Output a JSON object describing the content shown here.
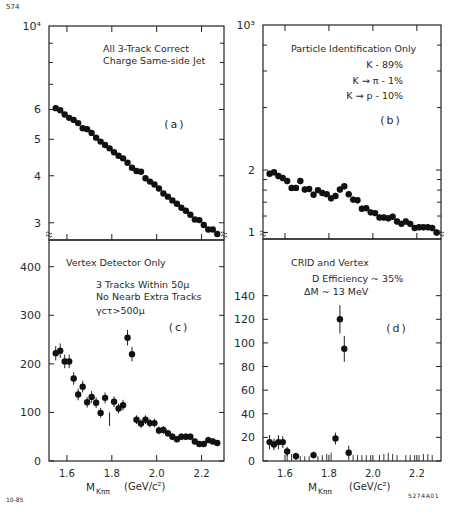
{
  "figure": {
    "corner_label": "574",
    "date_code": "10-85",
    "figure_id": "5274A01",
    "x_axis_label_main": "M",
    "x_axis_label_sub": "Kππ",
    "x_axis_units": "(GeV/c²)"
  },
  "chart_data": [
    {
      "panel": "a",
      "type": "scatter",
      "title": "All 3-Track Correct Charge Same-side Jet",
      "annotation_lines": [
        "All 3-Track Correct",
        "Charge Same-side Jet"
      ],
      "panel_label": "(a)",
      "xlabel": "",
      "ylabel": "",
      "y_scale": "log",
      "y_multiplier_label": "10⁴",
      "y_ticks": [
        {
          "value": 6,
          "label": "6"
        },
        {
          "value": 5,
          "label": "5"
        },
        {
          "value": 4,
          "label": "4"
        },
        {
          "value": 3,
          "label": "3"
        }
      ],
      "xlim": [
        1.52,
        2.3
      ],
      "ylim": [
        2.7,
        10
      ],
      "x": [
        1.55,
        1.57,
        1.59,
        1.61,
        1.63,
        1.65,
        1.67,
        1.69,
        1.71,
        1.73,
        1.75,
        1.77,
        1.79,
        1.81,
        1.83,
        1.85,
        1.87,
        1.89,
        1.91,
        1.93,
        1.95,
        1.97,
        1.99,
        2.01,
        2.03,
        2.05,
        2.07,
        2.09,
        2.11,
        2.13,
        2.15,
        2.17,
        2.19,
        2.21,
        2.23,
        2.25,
        2.27
      ],
      "y": [
        6.05,
        5.97,
        5.82,
        5.7,
        5.63,
        5.52,
        5.35,
        5.32,
        5.2,
        5.05,
        4.93,
        4.83,
        4.73,
        4.62,
        4.52,
        4.45,
        4.33,
        4.2,
        4.12,
        4.1,
        3.94,
        3.86,
        3.79,
        3.7,
        3.59,
        3.52,
        3.44,
        3.37,
        3.29,
        3.23,
        3.15,
        3.06,
        3.05,
        2.96,
        2.88,
        2.88,
        2.8
      ],
      "grid": false
    },
    {
      "panel": "b",
      "type": "scatter",
      "title": "Particle Identification Only",
      "annotation_lines": [
        "Particle Identification Only",
        "K - 89%",
        "K → π -   1%",
        "K → p - 10%"
      ],
      "panel_label": "(b)",
      "y_scale": "log",
      "y_multiplier_label": "10³",
      "y_ticks": [
        {
          "value": 2,
          "label": "2"
        },
        {
          "value": 1,
          "label": "1"
        }
      ],
      "xlim": [
        1.5,
        2.31
      ],
      "ylim": [
        0.93,
        10
      ],
      "x": [
        1.53,
        1.55,
        1.57,
        1.59,
        1.61,
        1.63,
        1.65,
        1.67,
        1.69,
        1.71,
        1.73,
        1.75,
        1.77,
        1.79,
        1.81,
        1.83,
        1.85,
        1.87,
        1.89,
        1.91,
        1.93,
        1.95,
        1.97,
        1.99,
        2.01,
        2.03,
        2.05,
        2.07,
        2.09,
        2.11,
        2.13,
        2.15,
        2.17,
        2.19,
        2.21,
        2.23,
        2.25,
        2.27,
        2.29
      ],
      "y": [
        1.92,
        1.95,
        1.87,
        1.83,
        1.77,
        1.64,
        1.64,
        1.77,
        1.61,
        1.62,
        1.52,
        1.6,
        1.55,
        1.53,
        1.46,
        1.5,
        1.61,
        1.67,
        1.53,
        1.44,
        1.43,
        1.3,
        1.31,
        1.25,
        1.24,
        1.18,
        1.18,
        1.17,
        1.19,
        1.13,
        1.1,
        1.13,
        1.1,
        1.05,
        1.06,
        1.06,
        1.06,
        1.05,
        1.0
      ],
      "y_err": 0.035,
      "grid": false
    },
    {
      "panel": "c",
      "type": "scatter",
      "title": "Vertex Detector Only",
      "annotation_lines": [
        "Vertex Detector Only",
        "3 Tracks Within 50μ",
        "No Nearb Extra Tracks",
        "γcτ>500μ"
      ],
      "panel_label": "(c)",
      "xlabel": "M_Kππ (GeV/c²)",
      "y_scale": "linear",
      "y_ticks": [
        {
          "value": 0,
          "label": "0"
        },
        {
          "value": 100,
          "label": "100"
        },
        {
          "value": 200,
          "label": "200"
        },
        {
          "value": 300,
          "label": "300"
        },
        {
          "value": 400,
          "label": "400"
        }
      ],
      "x_ticks": [
        {
          "value": 1.6,
          "label": "1.6"
        },
        {
          "value": 1.8,
          "label": "1.8"
        },
        {
          "value": 2.0,
          "label": "2.0"
        },
        {
          "value": 2.2,
          "label": "2.2"
        }
      ],
      "xlim": [
        1.52,
        2.3
      ],
      "ylim": [
        0,
        455
      ],
      "x": [
        1.55,
        1.57,
        1.59,
        1.61,
        1.63,
        1.65,
        1.67,
        1.69,
        1.71,
        1.73,
        1.75,
        1.77,
        1.79,
        1.81,
        1.83,
        1.85,
        1.87,
        1.89,
        1.91,
        1.93,
        1.95,
        1.97,
        1.99,
        2.01,
        2.03,
        2.05,
        2.07,
        2.09,
        2.11,
        2.13,
        2.15,
        2.17,
        2.19,
        2.21,
        2.23,
        2.25,
        2.27
      ],
      "y": [
        222,
        227,
        205,
        205,
        170,
        137,
        153,
        121,
        132,
        120,
        99,
        130,
        null,
        122,
        108,
        115,
        254,
        220,
        85,
        77,
        85,
        78,
        78,
        63,
        64,
        57,
        50,
        45,
        50,
        50,
        50,
        40,
        35,
        35,
        43,
        40,
        37
      ],
      "y_err": [
        15,
        15,
        14,
        14,
        13,
        12,
        12,
        11,
        12,
        11,
        10,
        11,
        0,
        11,
        10,
        11,
        16,
        15,
        9,
        9,
        9,
        9,
        9,
        8,
        8,
        7,
        7,
        7,
        7,
        7,
        7,
        6,
        6,
        6,
        7,
        6,
        6
      ],
      "grid": false
    },
    {
      "panel": "d",
      "type": "scatter",
      "title": "CRID and Vertex",
      "annotation_lines": [
        "CRID and Vertex",
        "D Efficiency ~ 35%",
        "ΔM ~ 13 MeV"
      ],
      "panel_label": "(d)",
      "xlabel": "M_Kππ (GeV/c²)",
      "y_scale": "linear",
      "y_ticks": [
        {
          "value": 0,
          "label": "0"
        },
        {
          "value": 20,
          "label": "20"
        },
        {
          "value": 40,
          "label": "40"
        },
        {
          "value": 60,
          "label": "60"
        },
        {
          "value": 80,
          "label": "80"
        },
        {
          "value": 100,
          "label": "100"
        },
        {
          "value": 120,
          "label": "120"
        },
        {
          "value": 140,
          "label": "140"
        }
      ],
      "x_ticks": [
        {
          "value": 1.6,
          "label": "1.6"
        },
        {
          "value": 1.8,
          "label": "1.8"
        },
        {
          "value": 2.0,
          "label": "2.0"
        },
        {
          "value": 2.2,
          "label": "2.2"
        }
      ],
      "xlim": [
        1.5,
        2.31
      ],
      "ylim": [
        0,
        188
      ],
      "x": [
        1.53,
        1.55,
        1.57,
        1.59,
        1.61,
        1.65,
        1.73,
        1.83,
        1.85,
        1.87,
        1.89
      ],
      "y": [
        16,
        14,
        16,
        16,
        8,
        4,
        5,
        19,
        120,
        95,
        7
      ],
      "y_err": [
        6,
        5,
        6,
        5,
        4,
        3,
        3,
        5,
        12,
        11,
        6
      ],
      "upper_limit_bars": {
        "x": [
          1.61,
          1.63,
          1.67,
          1.69,
          1.71,
          1.75,
          1.77,
          1.79,
          1.81,
          1.91,
          1.93,
          1.95,
          1.97,
          1.99,
          2.03,
          2.05,
          2.07,
          2.09,
          2.11,
          2.15,
          2.17,
          2.19,
          2.21,
          2.23,
          2.25,
          2.27
        ],
        "y": [
          6,
          6,
          4,
          4,
          4,
          4,
          5,
          6,
          7,
          5,
          5,
          5,
          5,
          5,
          5,
          6,
          7,
          6,
          5,
          5,
          5,
          5,
          5,
          6,
          6,
          5
        ]
      },
      "grid": false
    }
  ]
}
